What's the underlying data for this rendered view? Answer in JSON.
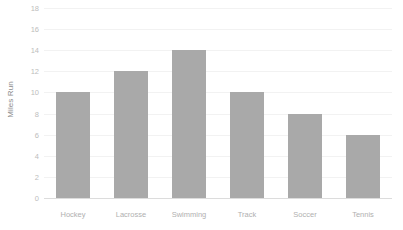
{
  "chart_data": {
    "type": "bar",
    "title": "",
    "subtitle": "",
    "xlabel": "",
    "ylabel": "Miles Run",
    "categories": [
      "Hockey",
      "Lacrosse",
      "Swimming",
      "Track",
      "Soccer",
      "Tennis"
    ],
    "values": [
      10,
      12,
      14,
      10,
      8,
      6
    ],
    "ylim": [
      0,
      18
    ],
    "ytick_labels": [
      "0",
      "2",
      "4",
      "6",
      "8",
      "10",
      "12",
      "14",
      "16",
      "18"
    ],
    "ytick_values": [
      0,
      2,
      4,
      6,
      8,
      10,
      12,
      14,
      16,
      18
    ],
    "grid": true,
    "legend": false,
    "legend_position": "none",
    "bar_color": "#a9a9a9",
    "gridline_color": "#f2f2f2",
    "axis_line_color": "#dcdcdc",
    "tick_label_color": "#bdbdbd",
    "category_label_color": "#b0b0b0",
    "axis_title_color": "#8c8c8c",
    "background_color": "#ffffff"
  }
}
